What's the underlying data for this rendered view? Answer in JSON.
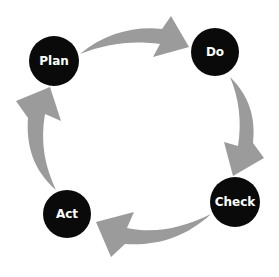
{
  "diagram": {
    "title": "",
    "type": "PDCA cycle",
    "colors": {
      "node_fill": "#0a0a0a",
      "node_text": "#ffffff",
      "arrow": "#9b9b9b",
      "background": "#ffffff"
    },
    "nodes": [
      {
        "id": "plan",
        "label": "Plan",
        "cx": 54,
        "cy": 61,
        "r": 25
      },
      {
        "id": "do",
        "label": "Do",
        "cx": 215,
        "cy": 52,
        "r": 24
      },
      {
        "id": "check",
        "label": "Check",
        "cx": 235,
        "cy": 202,
        "r": 25
      },
      {
        "id": "act",
        "label": "Act",
        "cx": 67,
        "cy": 214,
        "r": 24
      }
    ],
    "edges": [
      {
        "from": "plan",
        "to": "do"
      },
      {
        "from": "do",
        "to": "check"
      },
      {
        "from": "check",
        "to": "act"
      },
      {
        "from": "act",
        "to": "plan"
      }
    ]
  }
}
